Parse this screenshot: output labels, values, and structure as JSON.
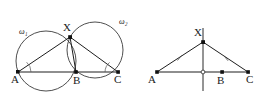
{
  "figure": {
    "background_color": "#ffffff",
    "stroke_color": "#333333",
    "point_color": "#111111",
    "label_color": "#1a1a1a",
    "width": 271,
    "height": 106
  },
  "left_diagram": {
    "name": "intersecting-circles-diagram",
    "circles": [
      {
        "label": "w",
        "subscript": "1",
        "display": "ω₁",
        "cx": 46,
        "cy": 61,
        "r": 30,
        "label_x": 19,
        "label_y": 34
      },
      {
        "label": "w",
        "subscript": "2",
        "display": "ω₂",
        "cx": 95,
        "cy": 50,
        "r": 28,
        "label_x": 119,
        "label_y": 24
      }
    ],
    "points": [
      {
        "id": "A",
        "label": "A",
        "x": 18,
        "y": 72,
        "label_x": 11,
        "label_y": 83
      },
      {
        "id": "X",
        "label": "X",
        "x": 70,
        "y": 37,
        "label_x": 63,
        "label_y": 31
      },
      {
        "id": "B",
        "label": "B",
        "x": 76,
        "y": 72,
        "label_x": 73,
        "label_y": 84
      },
      {
        "id": "C",
        "label": "C",
        "x": 118,
        "y": 72,
        "label_x": 114,
        "label_y": 83
      }
    ],
    "segments": [
      {
        "name": "segment-A-C",
        "from": "A",
        "to": "C"
      },
      {
        "name": "segment-A-X",
        "from": "A",
        "to": "X"
      },
      {
        "name": "segment-X-B",
        "from": "X",
        "to": "B"
      },
      {
        "name": "segment-X-C",
        "from": "X",
        "to": "C"
      }
    ],
    "angle_marks": [
      {
        "name": "angle-mark-at-A",
        "vertex": "A",
        "radius": 13
      },
      {
        "name": "angle-mark-at-C",
        "vertex": "C",
        "radius": 13
      }
    ]
  },
  "right_diagram": {
    "name": "isosceles-triangle-diagram",
    "points": [
      {
        "id": "A",
        "label": "A",
        "x": 157,
        "y": 72,
        "label_x": 148,
        "label_y": 83
      },
      {
        "id": "X",
        "label": "X",
        "x": 203,
        "y": 42,
        "label_x": 194,
        "label_y": 36
      },
      {
        "id": "B",
        "label": "B",
        "x": 222,
        "y": 72,
        "label_x": 217,
        "label_y": 84
      },
      {
        "id": "C",
        "label": "C",
        "x": 248,
        "y": 72,
        "label_x": 246,
        "label_y": 83
      },
      {
        "id": "M",
        "label": "",
        "x": 203,
        "y": 72,
        "hollow": true
      }
    ],
    "segments": [
      {
        "name": "segment-A-C",
        "from": "A",
        "to": "C"
      },
      {
        "name": "segment-A-X",
        "from": "A",
        "to": "X"
      },
      {
        "name": "segment-X-C",
        "from": "X",
        "to": "C"
      }
    ],
    "vertical_line": {
      "name": "perpendicular-bisector",
      "x": 203,
      "y1": 28,
      "y2": 91
    },
    "tick_marks": [
      {
        "name": "tick-on-AX",
        "on": "A-X"
      },
      {
        "name": "tick-on-XC",
        "on": "X-C"
      }
    ]
  }
}
